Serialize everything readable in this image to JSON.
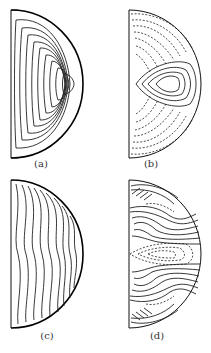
{
  "figure": {
    "panels": [
      {
        "id": "a",
        "label": "(a)",
        "contour_style": "solid",
        "description": "nested solid contours concentric toward right edge midpoint"
      },
      {
        "id": "b",
        "label": "(b)",
        "contour_style": "solid+dashed",
        "description": "central closed solid cell with dashed contours above and below"
      },
      {
        "id": "c",
        "label": "(c)",
        "contour_style": "solid",
        "description": "S-shaped solid contours bending toward right edge"
      },
      {
        "id": "d",
        "label": "(d)",
        "contour_style": "solid+dashed",
        "description": "multi-cell pattern with dense solid bands and dashed regions"
      }
    ]
  }
}
